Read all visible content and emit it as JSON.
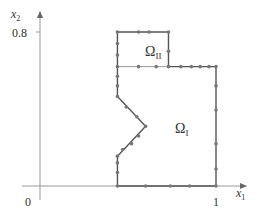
{
  "figure": {
    "axes": {
      "x_label": "x",
      "x_label_sub": "1",
      "y_label": "x",
      "y_label_sub": "2",
      "origin_label": "0",
      "x_tick_label": "1",
      "y_tick_label": "0.8"
    },
    "regions": [
      {
        "name": "Omega_I",
        "label": "Ω",
        "sub": "I"
      },
      {
        "name": "Omega_II",
        "label": "Ω",
        "sub": "II"
      }
    ],
    "colors": {
      "axis": "#888888",
      "boundary": "#555555",
      "interface": "#999999",
      "node": "#777777"
    },
    "domain_coords": {
      "note": "data units",
      "outer_boundary": [
        [
          0.44,
          0
        ],
        [
          0.44,
          0.155
        ],
        [
          0.6,
          0.31
        ],
        [
          0.44,
          0.465
        ],
        [
          0.44,
          0.8
        ],
        [
          0.73,
          0.8
        ],
        [
          0.73,
          0.62
        ],
        [
          1.0,
          0.62
        ],
        [
          1.0,
          0
        ]
      ],
      "interface": [
        [
          0.44,
          0.62
        ],
        [
          0.73,
          0.62
        ]
      ],
      "nodes": [
        [
          0.44,
          0
        ],
        [
          0.6,
          0
        ],
        [
          0.74,
          0
        ],
        [
          0.85,
          0
        ],
        [
          1.0,
          0
        ],
        [
          1.0,
          0.088
        ],
        [
          1.0,
          0.22
        ],
        [
          1.0,
          0.395
        ],
        [
          1.0,
          0.52
        ],
        [
          1.0,
          0.62
        ],
        [
          0.96,
          0.62
        ],
        [
          0.91,
          0.62
        ],
        [
          0.86,
          0.62
        ],
        [
          0.8,
          0.62
        ],
        [
          0.73,
          0.62
        ],
        [
          0.73,
          0.7
        ],
        [
          0.73,
          0.8
        ],
        [
          0.62,
          0.8
        ],
        [
          0.56,
          0.8
        ],
        [
          0.44,
          0.8
        ],
        [
          0.44,
          0.74
        ],
        [
          0.44,
          0.68
        ],
        [
          0.44,
          0.62
        ],
        [
          0.44,
          0.57
        ],
        [
          0.44,
          0.52
        ],
        [
          0.44,
          0.465
        ],
        [
          0.49,
          0.41
        ],
        [
          0.55,
          0.36
        ],
        [
          0.6,
          0.31
        ],
        [
          0.56,
          0.26
        ],
        [
          0.52,
          0.22
        ],
        [
          0.47,
          0.19
        ],
        [
          0.44,
          0.155
        ],
        [
          0.44,
          0.12
        ],
        [
          0.44,
          0.07
        ],
        [
          0.66,
          0.62
        ],
        [
          0.56,
          0.62
        ]
      ]
    }
  }
}
